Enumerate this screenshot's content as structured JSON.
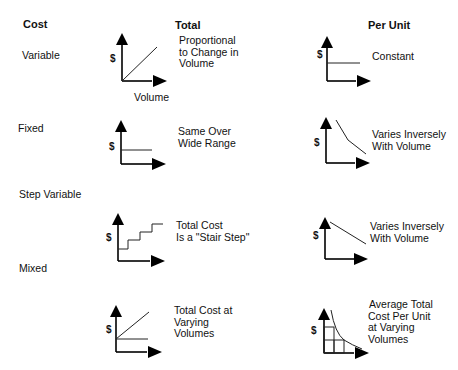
{
  "headers": {
    "cost": "Cost",
    "total": "Total",
    "per_unit": "Per Unit"
  },
  "axis": {
    "y_label": "$",
    "x_label": "Volume"
  },
  "rows": [
    {
      "label": "Variable",
      "total": {
        "line1": "Proportional",
        "line2": "to Change in",
        "line3": "Volume",
        "shape": "rising-line"
      },
      "per_unit": {
        "line1": "Constant",
        "shape": "flat-line"
      }
    },
    {
      "label": "Fixed",
      "total": {
        "line1": "Same Over",
        "line2": "Wide Range",
        "shape": "flat-line"
      },
      "per_unit": {
        "line1": "Varies Inversely",
        "line2": "With Volume",
        "shape": "declining-curve"
      }
    },
    {
      "label": "Step Variable",
      "total": {
        "line1": "Total Cost",
        "line2": "Is a \"Stair Step\"",
        "shape": "stair-step"
      },
      "per_unit": {
        "line1": "Varies Inversely",
        "line2": "With Volume",
        "shape": "declining-line"
      }
    },
    {
      "label": "Mixed",
      "total": {
        "line1": "Total Cost at",
        "line2": "Varying",
        "line3": "Volumes",
        "shape": "fixed-plus-rising"
      },
      "per_unit": {
        "line1": "Average Total",
        "line2": "Cost Per Unit",
        "line3": "at Varying",
        "line4": "Volumes",
        "shape": "declining-curve-with-grid"
      }
    }
  ]
}
